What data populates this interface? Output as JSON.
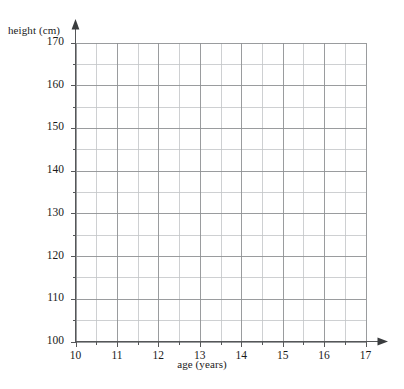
{
  "chart_data": {
    "type": "line",
    "title": "",
    "subtitle": "",
    "xlabel": "age (years)",
    "ylabel": "height (cm)",
    "xlim": [
      10,
      17
    ],
    "ylim": [
      100,
      170
    ],
    "x_major_ticks": [
      10,
      11,
      12,
      13,
      14,
      15,
      16,
      17
    ],
    "x_tick_labels": [
      "10",
      "11",
      "12",
      "13",
      "14",
      "15",
      "16",
      "17"
    ],
    "x_minor_step": 0.5,
    "y_major_ticks": [
      100,
      110,
      120,
      130,
      140,
      150,
      160,
      170
    ],
    "y_tick_labels": [
      "100",
      "110",
      "120",
      "130",
      "140",
      "150",
      "160",
      "170"
    ],
    "y_minor_step": 5,
    "grid": true,
    "legend": null,
    "legend_position": "none",
    "series": [],
    "annotations": [],
    "colors": {
      "grid_major": "#8f9194",
      "grid_minor": "#c2c4c7",
      "axis": "#555759",
      "text": "#1a1a1a",
      "background": "#ffffff"
    }
  },
  "axes": {
    "y": {
      "label": "height (cm)",
      "ticks": [
        {
          "value": 170,
          "label": "170"
        },
        {
          "value": 160,
          "label": "160"
        },
        {
          "value": 150,
          "label": "150"
        },
        {
          "value": 140,
          "label": "140"
        },
        {
          "value": 130,
          "label": "130"
        },
        {
          "value": 120,
          "label": "120"
        },
        {
          "value": 110,
          "label": "110"
        },
        {
          "value": 100,
          "label": "100"
        }
      ]
    },
    "x": {
      "label": "age (years)",
      "ticks": [
        {
          "value": 10,
          "label": "10"
        },
        {
          "value": 11,
          "label": "11"
        },
        {
          "value": 12,
          "label": "12"
        },
        {
          "value": 13,
          "label": "13"
        },
        {
          "value": 14,
          "label": "14"
        },
        {
          "value": 15,
          "label": "15"
        },
        {
          "value": 16,
          "label": "16"
        },
        {
          "value": 17,
          "label": "17"
        }
      ]
    }
  }
}
